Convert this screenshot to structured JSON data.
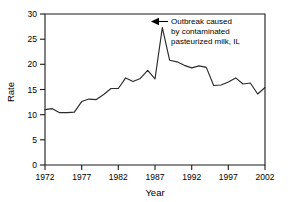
{
  "chart_data": {
    "type": "line",
    "title": "",
    "xlabel": "Year",
    "ylabel": "Rate",
    "xlim": [
      1972,
      2002
    ],
    "ylim": [
      0,
      30
    ],
    "grid": false,
    "legend": null,
    "xticks": [
      "1972",
      "1977",
      "1982",
      "1987",
      "1992",
      "1997",
      "2002"
    ],
    "xtick_values": [
      1972,
      1977,
      1982,
      1987,
      1992,
      1997,
      2002
    ],
    "yticks": [
      "0",
      "5",
      "10",
      "15",
      "20",
      "25",
      "30"
    ],
    "ytick_values": [
      0,
      5,
      10,
      15,
      20,
      25,
      30
    ],
    "x": [
      1972,
      1973,
      1974,
      1975,
      1976,
      1977,
      1978,
      1979,
      1980,
      1981,
      1982,
      1983,
      1984,
      1985,
      1986,
      1987,
      1988,
      1989,
      1990,
      1991,
      1992,
      1993,
      1994,
      1995,
      1996,
      1997,
      1998,
      1999,
      2000,
      2001,
      2002
    ],
    "values": [
      11.0,
      11.2,
      10.4,
      10.4,
      10.5,
      12.6,
      13.1,
      13.0,
      14.0,
      15.2,
      15.2,
      17.3,
      16.6,
      17.2,
      18.8,
      17.1,
      27.3,
      20.8,
      20.5,
      19.8,
      19.3,
      19.7,
      19.4,
      15.8,
      15.9,
      16.5,
      17.3,
      16.1,
      16.3,
      14.1,
      15.4
    ],
    "series": [
      {
        "name": "Rate",
        "color": "#2b2b2b",
        "values": [
          11.0,
          11.2,
          10.4,
          10.4,
          10.5,
          12.6,
          13.1,
          13.0,
          14.0,
          15.2,
          15.2,
          17.3,
          16.6,
          17.2,
          18.8,
          17.1,
          27.3,
          20.8,
          20.5,
          19.8,
          19.3,
          19.7,
          19.4,
          15.8,
          15.9,
          16.5,
          17.3,
          16.1,
          16.3,
          14.1,
          15.4
        ]
      }
    ],
    "annotations": [
      {
        "name": "outbreak-annotation",
        "lines": [
          "Outbreak caused",
          "by contaminated",
          "pasteurized milk, IL"
        ],
        "points_to_x": 1988,
        "points_to_y": 27.3,
        "arrow": "left"
      }
    ]
  }
}
